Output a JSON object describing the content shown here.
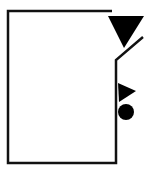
{
  "diagram": {
    "type": "schematic-symbol",
    "colors": {
      "background": "#ffffff",
      "stroke": "#111111",
      "fill": "#000000"
    },
    "elements": {
      "outline": {
        "points": "112,11 8,11 8,163 116,163 116,60 143,37",
        "stroke_width": 2.5
      },
      "large_triangle": {
        "points": "108,16 144,16 124,48",
        "direction": "down"
      },
      "small_triangle": {
        "points": "118,83 136,91 119,102",
        "direction": "right"
      },
      "circle": {
        "cx": 126,
        "cy": 112,
        "r": 8
      }
    }
  }
}
